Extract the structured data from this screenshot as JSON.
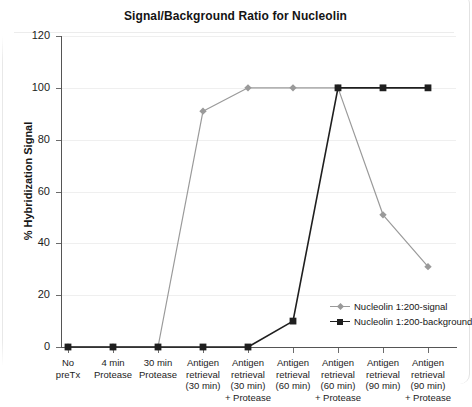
{
  "chart_data": {
    "type": "line",
    "title": "Signal/Background Ratio for Nucleolin",
    "xlabel": "",
    "ylabel": "% Hybridization Signal",
    "ylim": [
      0,
      120
    ],
    "yticks": [
      0,
      20,
      40,
      60,
      80,
      100,
      120
    ],
    "ytick_labels": [
      "0",
      "20",
      "40",
      "60",
      "80",
      "100",
      "120"
    ],
    "grid": true,
    "legend_position": "inside-bottom-right",
    "categories": [
      "No preTx",
      "4 min Protease",
      "30 min Protease",
      "Antigen retrieval (30 min)",
      "Antigen retrieval (30 min) + Protease",
      "Antigen retrieval (60 min)",
      "Antigen retrieval (60 min) + Protease",
      "Antigen retrieval (90 min)",
      "Antigen retrieval (90 min) + Protease"
    ],
    "category_lines": [
      [
        "No",
        "preTx"
      ],
      [
        "4 min",
        "Protease"
      ],
      [
        "30 min",
        "Protease"
      ],
      [
        "Antigen",
        "retrieval",
        "(30 min)"
      ],
      [
        "Antigen",
        "retrieval",
        "(30 min)",
        "+ Protease"
      ],
      [
        "Antigen",
        "retrieval",
        "(60 min)"
      ],
      [
        "Antigen",
        "retrieval",
        "(60 min)",
        "+ Protease"
      ],
      [
        "Antigen",
        "retrieval",
        "(90 min)"
      ],
      [
        "Antigen",
        "retrieval",
        "(90 min)",
        "+ Protease"
      ]
    ],
    "series": [
      {
        "name": "Nucleolin 1:200-signal",
        "color": "#9a9a9a",
        "marker": "diamond",
        "values": [
          0,
          0,
          0,
          91,
          100,
          100,
          100,
          51,
          31
        ]
      },
      {
        "name": "Nucleolin 1:200-background",
        "color": "#1f1f1f",
        "marker": "square",
        "values": [
          0,
          0,
          0,
          0,
          0,
          10,
          100,
          100,
          100
        ]
      }
    ]
  },
  "legend": {
    "items": [
      {
        "label": "Nucleolin 1:200-signal",
        "color": "#9a9a9a",
        "marker": "diamond"
      },
      {
        "label": "Nucleolin 1:200-background",
        "color": "#1f1f1f",
        "marker": "square"
      }
    ]
  },
  "colors": {
    "signal": "#9a9a9a",
    "background_series": "#1f1f1f",
    "axis": "#555555",
    "grid": "#efefef",
    "text": "#1a1a1a",
    "page": "#ffffff"
  }
}
